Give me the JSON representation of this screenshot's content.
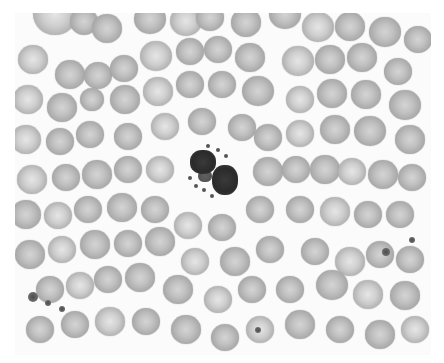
{
  "image": {
    "subject": "blood smear micrograph",
    "background_color": "#fbfbfb",
    "frame": {
      "x": 15,
      "y": 13,
      "width": 416,
      "height": 342
    }
  },
  "cells": [
    {
      "x": 55,
      "y": 15,
      "r": 22
    },
    {
      "x": 84,
      "y": 22,
      "r": 14
    },
    {
      "x": 107,
      "y": 29,
      "r": 15
    },
    {
      "x": 150,
      "y": 20,
      "r": 16
    },
    {
      "x": 186,
      "y": 22,
      "r": 16
    },
    {
      "x": 210,
      "y": 18,
      "r": 14
    },
    {
      "x": 246,
      "y": 23,
      "r": 15
    },
    {
      "x": 285,
      "y": 15,
      "r": 16
    },
    {
      "x": 318,
      "y": 28,
      "r": 16
    },
    {
      "x": 350,
      "y": 27,
      "r": 15
    },
    {
      "x": 385,
      "y": 33,
      "r": 16
    },
    {
      "x": 418,
      "y": 40,
      "r": 14
    },
    {
      "x": 33,
      "y": 60,
      "r": 15
    },
    {
      "x": 70,
      "y": 75,
      "r": 15
    },
    {
      "x": 98,
      "y": 76,
      "r": 14
    },
    {
      "x": 124,
      "y": 69,
      "r": 14
    },
    {
      "x": 156,
      "y": 57,
      "r": 16
    },
    {
      "x": 190,
      "y": 52,
      "r": 14
    },
    {
      "x": 218,
      "y": 50,
      "r": 14
    },
    {
      "x": 250,
      "y": 58,
      "r": 15
    },
    {
      "x": 298,
      "y": 62,
      "r": 16
    },
    {
      "x": 330,
      "y": 60,
      "r": 15
    },
    {
      "x": 362,
      "y": 58,
      "r": 15
    },
    {
      "x": 398,
      "y": 72,
      "r": 14
    },
    {
      "x": 28,
      "y": 100,
      "r": 15
    },
    {
      "x": 62,
      "y": 108,
      "r": 15
    },
    {
      "x": 92,
      "y": 100,
      "r": 12
    },
    {
      "x": 125,
      "y": 100,
      "r": 15
    },
    {
      "x": 158,
      "y": 92,
      "r": 15
    },
    {
      "x": 190,
      "y": 85,
      "r": 14
    },
    {
      "x": 222,
      "y": 85,
      "r": 14
    },
    {
      "x": 258,
      "y": 92,
      "r": 16
    },
    {
      "x": 300,
      "y": 100,
      "r": 14
    },
    {
      "x": 332,
      "y": 94,
      "r": 15
    },
    {
      "x": 366,
      "y": 95,
      "r": 15
    },
    {
      "x": 405,
      "y": 106,
      "r": 16
    },
    {
      "x": 26,
      "y": 140,
      "r": 15
    },
    {
      "x": 60,
      "y": 142,
      "r": 14
    },
    {
      "x": 90,
      "y": 135,
      "r": 14
    },
    {
      "x": 128,
      "y": 137,
      "r": 14
    },
    {
      "x": 165,
      "y": 127,
      "r": 14
    },
    {
      "x": 202,
      "y": 122,
      "r": 14
    },
    {
      "x": 242,
      "y": 128,
      "r": 14
    },
    {
      "x": 268,
      "y": 138,
      "r": 14
    },
    {
      "x": 300,
      "y": 134,
      "r": 14
    },
    {
      "x": 335,
      "y": 130,
      "r": 15
    },
    {
      "x": 370,
      "y": 132,
      "r": 16
    },
    {
      "x": 410,
      "y": 140,
      "r": 15
    },
    {
      "x": 32,
      "y": 180,
      "r": 15
    },
    {
      "x": 66,
      "y": 178,
      "r": 14
    },
    {
      "x": 97,
      "y": 175,
      "r": 15
    },
    {
      "x": 128,
      "y": 170,
      "r": 14
    },
    {
      "x": 160,
      "y": 170,
      "r": 14
    },
    {
      "x": 268,
      "y": 172,
      "r": 15
    },
    {
      "x": 296,
      "y": 170,
      "r": 14
    },
    {
      "x": 325,
      "y": 170,
      "r": 15
    },
    {
      "x": 352,
      "y": 172,
      "r": 14
    },
    {
      "x": 383,
      "y": 175,
      "r": 15
    },
    {
      "x": 412,
      "y": 178,
      "r": 14
    },
    {
      "x": 26,
      "y": 215,
      "r": 15
    },
    {
      "x": 58,
      "y": 216,
      "r": 14
    },
    {
      "x": 88,
      "y": 210,
      "r": 14
    },
    {
      "x": 122,
      "y": 208,
      "r": 15
    },
    {
      "x": 155,
      "y": 210,
      "r": 14
    },
    {
      "x": 188,
      "y": 226,
      "r": 14
    },
    {
      "x": 222,
      "y": 228,
      "r": 14
    },
    {
      "x": 260,
      "y": 210,
      "r": 14
    },
    {
      "x": 300,
      "y": 210,
      "r": 14
    },
    {
      "x": 335,
      "y": 212,
      "r": 15
    },
    {
      "x": 368,
      "y": 215,
      "r": 14
    },
    {
      "x": 400,
      "y": 215,
      "r": 14
    },
    {
      "x": 30,
      "y": 255,
      "r": 15
    },
    {
      "x": 62,
      "y": 250,
      "r": 14
    },
    {
      "x": 95,
      "y": 245,
      "r": 15
    },
    {
      "x": 128,
      "y": 244,
      "r": 14
    },
    {
      "x": 160,
      "y": 242,
      "r": 15
    },
    {
      "x": 195,
      "y": 262,
      "r": 14
    },
    {
      "x": 235,
      "y": 262,
      "r": 15
    },
    {
      "x": 270,
      "y": 250,
      "r": 14
    },
    {
      "x": 315,
      "y": 252,
      "r": 14
    },
    {
      "x": 350,
      "y": 262,
      "r": 15
    },
    {
      "x": 380,
      "y": 255,
      "r": 14
    },
    {
      "x": 410,
      "y": 260,
      "r": 14
    },
    {
      "x": 50,
      "y": 290,
      "r": 14
    },
    {
      "x": 80,
      "y": 286,
      "r": 14
    },
    {
      "x": 108,
      "y": 280,
      "r": 14
    },
    {
      "x": 140,
      "y": 278,
      "r": 15
    },
    {
      "x": 178,
      "y": 290,
      "r": 15
    },
    {
      "x": 218,
      "y": 300,
      "r": 14
    },
    {
      "x": 252,
      "y": 290,
      "r": 14
    },
    {
      "x": 290,
      "y": 290,
      "r": 14
    },
    {
      "x": 332,
      "y": 286,
      "r": 16
    },
    {
      "x": 368,
      "y": 295,
      "r": 15
    },
    {
      "x": 405,
      "y": 296,
      "r": 15
    },
    {
      "x": 40,
      "y": 330,
      "r": 14
    },
    {
      "x": 75,
      "y": 325,
      "r": 14
    },
    {
      "x": 110,
      "y": 322,
      "r": 15
    },
    {
      "x": 146,
      "y": 322,
      "r": 14
    },
    {
      "x": 186,
      "y": 330,
      "r": 15
    },
    {
      "x": 225,
      "y": 338,
      "r": 14
    },
    {
      "x": 260,
      "y": 330,
      "r": 14
    },
    {
      "x": 300,
      "y": 325,
      "r": 15
    },
    {
      "x": 340,
      "y": 330,
      "r": 14
    },
    {
      "x": 380,
      "y": 335,
      "r": 15
    },
    {
      "x": 415,
      "y": 330,
      "r": 14
    }
  ],
  "white_blood_cell": {
    "x": 212,
    "y": 170,
    "label": "neutrophil"
  },
  "platelets": [
    {
      "x": 33,
      "y": 297,
      "r": 5
    },
    {
      "x": 48,
      "y": 303,
      "r": 3
    },
    {
      "x": 62,
      "y": 309,
      "r": 3
    },
    {
      "x": 386,
      "y": 252,
      "r": 4
    },
    {
      "x": 412,
      "y": 240,
      "r": 3
    },
    {
      "x": 258,
      "y": 330,
      "r": 3
    }
  ]
}
